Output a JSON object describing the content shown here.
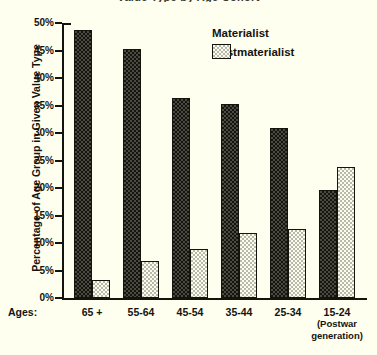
{
  "chart_data": {
    "type": "bar",
    "title": "Value Type by Age Cohort",
    "xlabel": "Ages:",
    "ylabel": "Percentage of Age Group in Given Value Type",
    "categories": [
      "65 +",
      "55-64",
      "45-54",
      "35-44",
      "25-34",
      "15-24"
    ],
    "category_sublabels": [
      "",
      "",
      "",
      "",
      "",
      "(Postwar generation)"
    ],
    "series": [
      {
        "name": "Materialist",
        "color": "#2a2a20",
        "values": [
          48.7,
          45.3,
          36.4,
          35.2,
          30.9,
          19.7
        ]
      },
      {
        "name": "Postmaterialist",
        "color": "#eeeee0",
        "values": [
          3.3,
          6.7,
          9.0,
          11.9,
          12.6,
          23.8
        ]
      }
    ],
    "ylim": [
      0,
      50
    ],
    "ytick_step": 5,
    "ytick_labels": [
      "50%",
      "45%",
      "40%",
      "35%",
      "30%",
      "25%",
      "20%",
      "15%",
      "10%",
      "5%",
      "0%"
    ],
    "grid": false,
    "legend_position": "top-right"
  },
  "legend": {
    "items": [
      {
        "label": "Materialist"
      },
      {
        "label": "Postmaterialist"
      }
    ]
  },
  "axis": {
    "x_prefix": "Ages:",
    "y_title": "Percentage of Age Group in Given Value Type"
  },
  "x_labels": [
    {
      "main": "65 +",
      "sub": ""
    },
    {
      "main": "55-64",
      "sub": ""
    },
    {
      "main": "45-54",
      "sub": ""
    },
    {
      "main": "35-44",
      "sub": ""
    },
    {
      "main": "25-34",
      "sub": ""
    },
    {
      "main": "15-24",
      "sub": "(Postwar\ngeneration)"
    }
  ]
}
